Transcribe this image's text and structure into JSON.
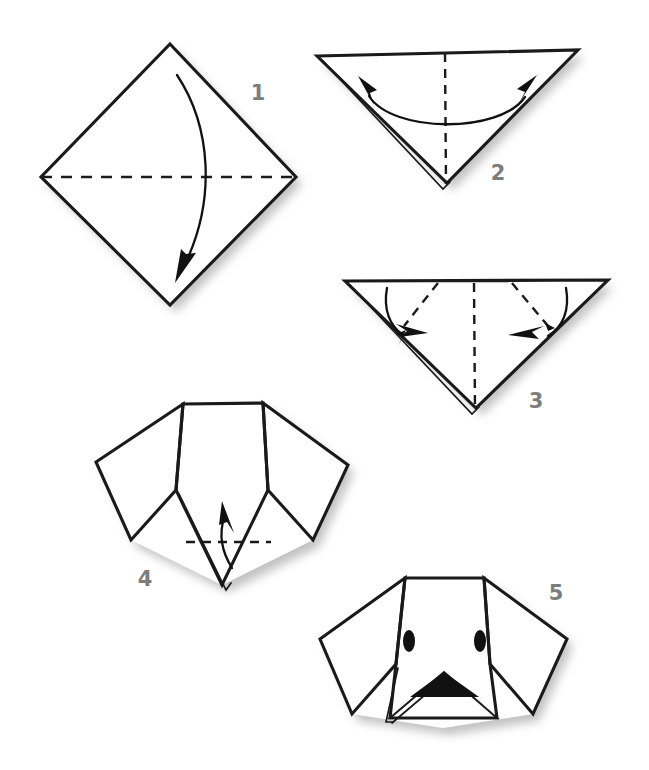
{
  "figure": {
    "background_color": "#ffffff",
    "ink_color": "#1a1a1a",
    "number_color": "#7d7d7d",
    "shadow_color": "#c9c9c9"
  },
  "steps": [
    {
      "number": "1",
      "label_x": 258,
      "label_y": 100,
      "shape": "square-diamond",
      "description": "Square sheet placed as a diamond with a horizontal dashed crease across the middle; curved arrow folds the top corner down to the bottom corner.",
      "fold_line": "horizontal-dashed-center",
      "arrow": "single-curved-down"
    },
    {
      "number": "2",
      "label_x": 498,
      "label_y": 180,
      "shape": "downward-triangle",
      "description": "Folded triangle pointing down with a vertical dashed centre crease; double-headed curved arrow marks the left-right symmetry fold.",
      "fold_line": "vertical-dashed-center",
      "arrow": "double-headed-curved"
    },
    {
      "number": "3",
      "label_x": 536,
      "label_y": 408,
      "shape": "wide-downward-triangle",
      "description": "Wide triangle with vertical dashed centre crease plus two diagonal dashed creases; two curved arrows fold the side flaps inward to form the ears.",
      "fold_line": "vertical-dashed-center-plus-two-diagonals",
      "arrow": "two-curved-inward"
    },
    {
      "number": "4",
      "label_x": 145,
      "label_y": 586,
      "shape": "dog-head-with-ears",
      "description": "Dog head shape with two floppy ears; dashed horizontal crease near the chin and a curved arrow folding the bottom point up.",
      "fold_line": "horizontal-dashed-chin",
      "arrow": "single-curved-up"
    },
    {
      "number": "5",
      "label_x": 556,
      "label_y": 600,
      "shape": "finished-dog-face",
      "description": "Finished dog face with two oval eyes and a black triangular nose on the folded muzzle.",
      "fold_line": "none",
      "arrow": "none",
      "features": [
        "left-eye",
        "right-eye",
        "nose",
        "muzzle"
      ]
    }
  ],
  "chart_data": {
    "type": "diagram",
    "step_count": 5,
    "step_labels": [
      "1",
      "2",
      "3",
      "4",
      "5"
    ]
  }
}
